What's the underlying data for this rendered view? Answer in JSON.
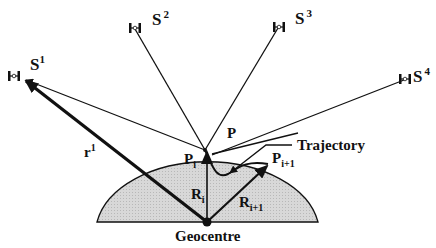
{
  "diagram": {
    "satellites": [
      {
        "name": "S",
        "sup": "1"
      },
      {
        "name": "S",
        "sup": "2"
      },
      {
        "name": "S",
        "sup": "3"
      },
      {
        "name": "S",
        "sup": "4"
      }
    ],
    "labels": {
      "point_p": "P",
      "trajectory": "Trajectory",
      "pi_main": "P",
      "pi_sub": "i",
      "pi1_main": "P",
      "pi1_sub": "i+1",
      "ri_main": "R",
      "ri_sub": "i",
      "ri1_main": "R",
      "ri1_sub": "i+1",
      "r1_main": "r",
      "r1_sup": "1",
      "geocentre": "Geocentre"
    },
    "colors": {
      "earth_fill": "#d4d4d4",
      "line": "#111111"
    }
  }
}
